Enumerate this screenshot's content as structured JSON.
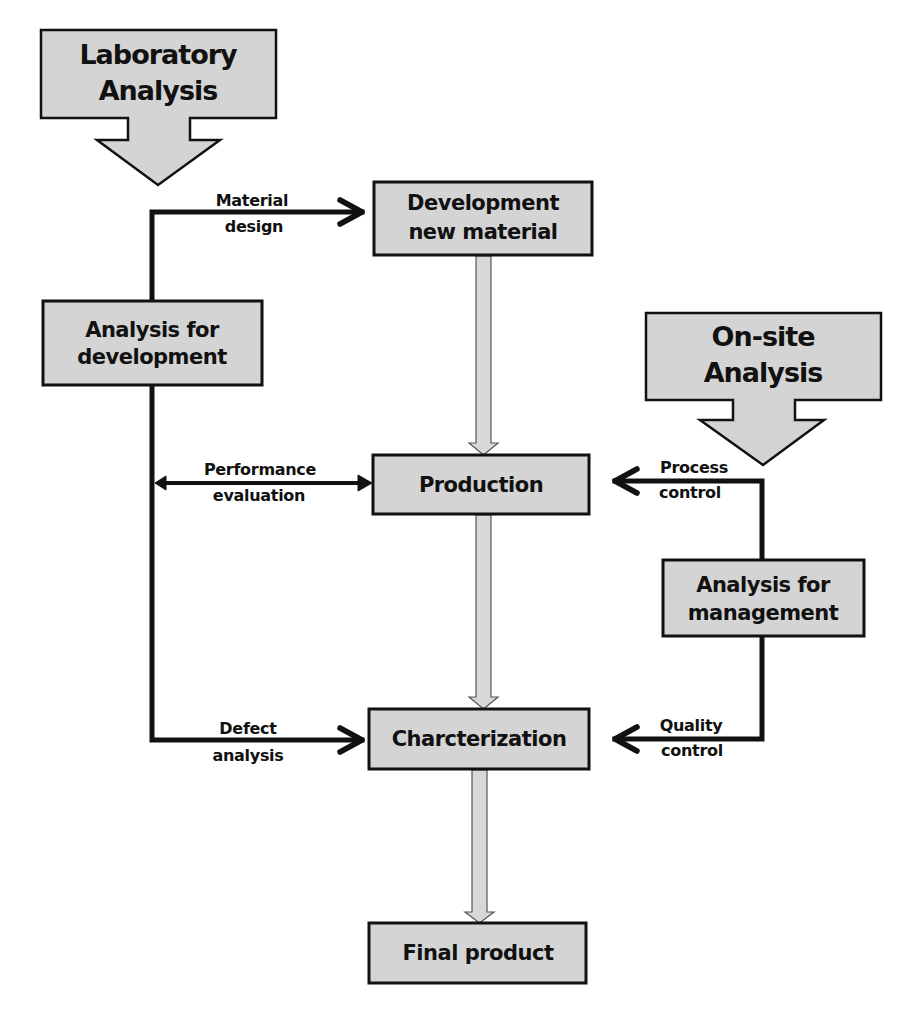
{
  "diagram": {
    "sources": {
      "laboratory": {
        "line1": "Laboratory",
        "line2": "Analysis"
      },
      "onsite": {
        "line1": "On-site",
        "line2": "Analysis"
      }
    },
    "nodes": {
      "analysis_development": {
        "line1": "Analysis for",
        "line2": "development"
      },
      "development_material": {
        "line1": "Development",
        "line2": "new material"
      },
      "production": {
        "label": "Production"
      },
      "characterization": {
        "label": "Charcterization"
      },
      "final_product": {
        "label": "Final product"
      },
      "analysis_management": {
        "line1": "Analysis for",
        "line2": "management"
      }
    },
    "edges": {
      "material_design": {
        "line1": "Material",
        "line2": "design"
      },
      "performance_evaluation": {
        "line1": "Performance",
        "line2": "evaluation"
      },
      "defect_analysis": {
        "line1": "Defect",
        "line2": "analysis"
      },
      "process_control": {
        "line1": "Process",
        "line2": "control"
      },
      "quality_control": {
        "line1": "Quality",
        "line2": "control"
      }
    },
    "colors": {
      "box_fill": "#d4d4d4",
      "stroke": "#111111",
      "background": "#ffffff"
    }
  }
}
